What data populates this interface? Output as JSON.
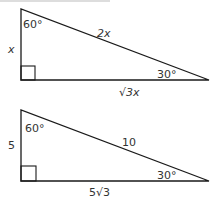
{
  "diagram": {
    "line_color": "#1a1a1a",
    "text_color": "#333333",
    "triangles": [
      {
        "name": "general",
        "angle_top": "60°",
        "angle_right": "30°",
        "short_leg": "x",
        "hypotenuse": "2x",
        "long_leg": "√3x"
      },
      {
        "name": "example",
        "angle_top": "60°",
        "angle_right": "30°",
        "short_leg": "5",
        "hypotenuse": "10",
        "long_leg": "5√3"
      }
    ]
  }
}
